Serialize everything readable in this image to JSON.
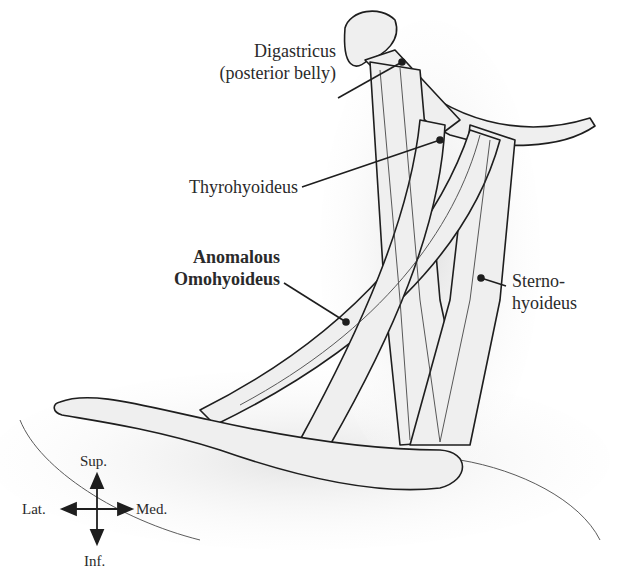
{
  "figure": {
    "labels": {
      "digastricus_line1": "Digastricus",
      "digastricus_line2": "(posterior belly)",
      "thyrohyoideus": "Thyrohyoideus",
      "anomalous_line1": "Anomalous",
      "anomalous_line2": "Omohyoideus",
      "sterno_line1": "Sterno-",
      "sterno_line2": "hyoideus"
    },
    "orientation": {
      "sup": "Sup.",
      "inf": "Inf.",
      "lat": "Lat.",
      "med": "Med."
    }
  },
  "colors": {
    "ink": "#1e1e1e",
    "muscle_fill": "#eeeeee",
    "shade": "#d8d8d8"
  }
}
